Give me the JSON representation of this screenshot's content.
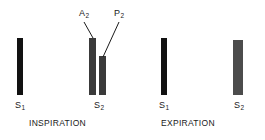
{
  "figure": {
    "background_color": "#ffffff",
    "width": 265,
    "height": 140
  },
  "chart_data": {
    "type": "bar",
    "title": "",
    "xlabel": "",
    "ylabel": "",
    "grid": false,
    "legend_position": "none",
    "baseline_y": 95,
    "groups": [
      {
        "phase": "INSPIRATION",
        "bars": [
          {
            "id": "insp-s1",
            "label": "S1",
            "component": null,
            "x": 17,
            "y": 38,
            "width": 6,
            "height": 57,
            "color": "#111111"
          },
          {
            "id": "insp-s2-a2",
            "label": "S2",
            "component": "A2",
            "x": 89,
            "y": 38,
            "width": 7,
            "height": 57,
            "color": "#3a3a3a"
          },
          {
            "id": "insp-s2-p2",
            "label": "S2",
            "component": "P2",
            "x": 99,
            "y": 56,
            "width": 7,
            "height": 39,
            "color": "#3a3a3a"
          }
        ]
      },
      {
        "phase": "EXPIRATION",
        "bars": [
          {
            "id": "exp-s1",
            "label": "S1",
            "component": null,
            "x": 161,
            "y": 38,
            "width": 6,
            "height": 57,
            "color": "#111111"
          },
          {
            "id": "exp-s2",
            "label": "S2",
            "component": null,
            "x": 233,
            "y": 40,
            "width": 10,
            "height": 55,
            "color": "#4c4c4c"
          }
        ]
      }
    ]
  },
  "annotations": {
    "components": [
      {
        "name": "a2-label",
        "text": "A",
        "subscript": "2",
        "x": 79,
        "y": 9,
        "leader": {
          "x1": 84,
          "y1": 22,
          "x2": 93,
          "y2": 38
        }
      },
      {
        "name": "p2-label",
        "text": "P",
        "subscript": "2",
        "x": 114,
        "y": 9,
        "leader": {
          "x1": 119,
          "y1": 22,
          "x2": 103,
          "y2": 57
        }
      }
    ],
    "leader_color": "#1a1a1a",
    "leader_width": 1
  },
  "sound_labels": [
    {
      "name": "insp-s1-label",
      "text": "S",
      "subscript": "1",
      "x": 15,
      "y": 101
    },
    {
      "name": "insp-s2-label",
      "text": "S",
      "subscript": "2",
      "x": 94,
      "y": 101
    },
    {
      "name": "exp-s1-label",
      "text": "S",
      "subscript": "1",
      "x": 159,
      "y": 101
    },
    {
      "name": "exp-s2-label",
      "text": "S",
      "subscript": "2",
      "x": 234,
      "y": 101
    }
  ],
  "phase_labels": [
    {
      "name": "inspiration-label",
      "text": "INSPIRATION",
      "x": 29,
      "y": 119
    },
    {
      "name": "expiration-label",
      "text": "EXPIRATION",
      "x": 161,
      "y": 119
    }
  ]
}
